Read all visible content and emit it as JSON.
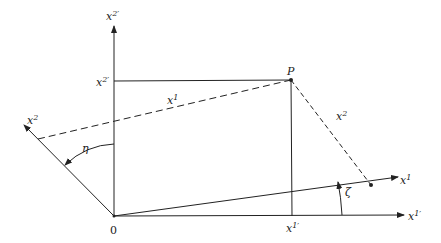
{
  "diagram": {
    "type": "coordinate-rotation",
    "origin": {
      "label": "0"
    },
    "point": {
      "label": "P"
    },
    "axes": {
      "x2_prime": {
        "base": "x",
        "sup": "2′"
      },
      "x1_prime": {
        "base": "x",
        "sup": "1′"
      },
      "x1": {
        "base": "x",
        "sup": "1"
      },
      "x2": {
        "base": "x",
        "sup": "2"
      }
    },
    "tick_labels": {
      "x2_prime_tick": {
        "base": "x",
        "sup": "2′"
      },
      "x1_prime_tick": {
        "base": "x",
        "sup": "1′"
      }
    },
    "component_labels": {
      "x1_component": {
        "base": "x",
        "sup": "1"
      },
      "x2_component": {
        "base": "x",
        "sup": "2"
      }
    },
    "angles": {
      "eta": "η",
      "zeta": "ζ"
    },
    "colors": {
      "ink": "#222222",
      "background": "#ffffff"
    }
  }
}
